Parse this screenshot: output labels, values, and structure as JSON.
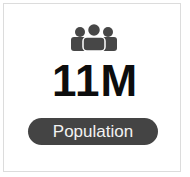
{
  "card": {
    "icon": "people-group-icon",
    "value": "11M",
    "label": "Population"
  },
  "colors": {
    "icon": "#474747",
    "value": "#0d0d0d",
    "pill_bg": "#444444",
    "pill_text": "#f2f2f2",
    "border": "#dcdcdc"
  }
}
